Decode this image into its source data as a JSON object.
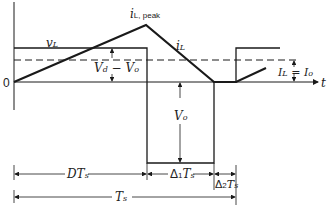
{
  "diagram": {
    "labels": {
      "origin": "0",
      "time_axis": "t",
      "vL": "v",
      "vL_sub": "L",
      "iL_peak": "i",
      "iL_peak_sub": "L, peak",
      "iL": "i",
      "iL_sub": "L",
      "vd_minus_vo": "V",
      "vd_minus_vo_sub1": "d",
      "vd_minus_vo_mid": " − V",
      "vd_minus_vo_sub2": "o",
      "vo": "V",
      "vo_sub": "o",
      "avg_current_left": "I",
      "avg_current_left_sub": "L",
      "avg_current_eq": " = I",
      "avg_current_right_sub": "o",
      "dts": "DT",
      "dts_sub": "s",
      "delta1": "Δ",
      "delta1_sub": "1",
      "delta1_T": "T",
      "delta1_T_sub": "s",
      "delta2": "Δ",
      "delta2_sub": "2",
      "delta2_T": "T",
      "delta2_T_sub": "s",
      "ts": "T",
      "ts_sub": "s"
    },
    "colors": {
      "stroke": "#1a1a1a",
      "background": "#ffffff"
    }
  }
}
